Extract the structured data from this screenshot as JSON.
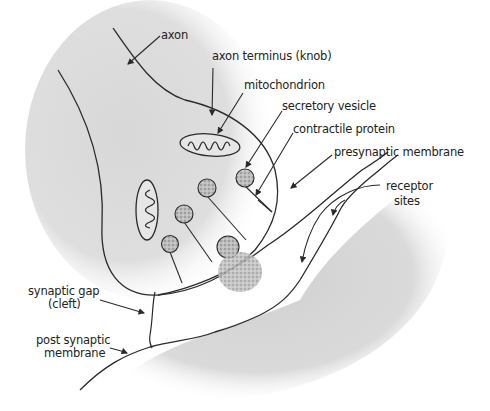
{
  "diagram": {
    "type": "synapse-anatomy",
    "labels": {
      "axon": "axon",
      "axon_terminus": "axon terminus (knob)",
      "mitochondrion": "mitochondrion",
      "secretory_vesicle": "secretory vesicle",
      "contractile_protein": "contractile protein",
      "presynaptic_membrane": "presynaptic membrane",
      "receptor_sites_line1": "receptor",
      "receptor_sites_line2": "sites",
      "synaptic_gap_line1": "synaptic gap",
      "synaptic_gap_line2": "(cleft)",
      "post_synaptic_line1": "post synaptic",
      "post_synaptic_line2": "membrane"
    },
    "colors": {
      "ink": "#2a2a2a",
      "shade": "#d4d4d4",
      "background": "#ffffff"
    }
  }
}
